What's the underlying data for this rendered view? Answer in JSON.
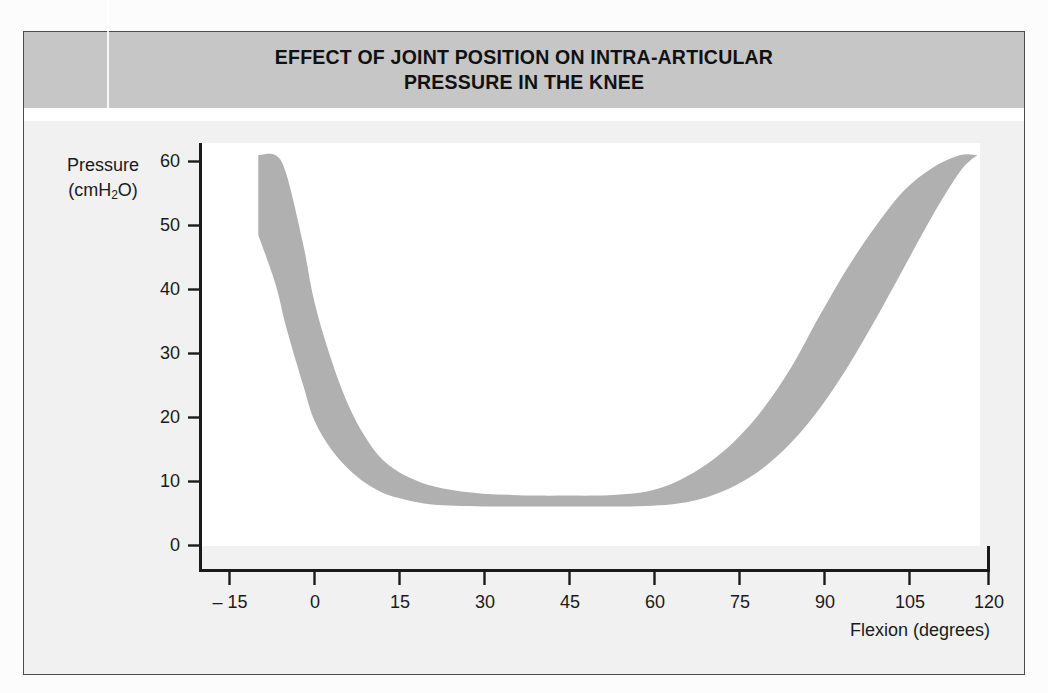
{
  "figure": {
    "title_line1": "EFFECT OF JOINT POSITION ON INTRA-ARTICULAR",
    "title_line2": "PRESSURE IN THE KNEE",
    "banner_color": "#c6c6c6",
    "band_color": "#b0b0b0",
    "plot_background": "#ffffff",
    "axis_color": "#1a1a1a"
  },
  "axes": {
    "y_title_line1": "Pressure",
    "y_title_prefix": "(cmH",
    "y_title_sub": "2",
    "y_title_suffix": "O)",
    "x_title": "Flexion (degrees)"
  },
  "chart_data": {
    "type": "area",
    "title": "EFFECT OF JOINT POSITION ON INTRA-ARTICULAR PRESSURE IN THE KNEE",
    "xlabel": "Flexion (degrees)",
    "ylabel": "Pressure (cmH2O)",
    "xlim": [
      -20,
      120
    ],
    "ylim": [
      0,
      63
    ],
    "xticks": [
      -15,
      0,
      15,
      30,
      45,
      60,
      75,
      90,
      105,
      120
    ],
    "yticks": [
      0,
      10,
      20,
      30,
      40,
      50,
      60
    ],
    "grid": false,
    "legend": null,
    "x": [
      -10,
      -7,
      -5,
      -2,
      0,
      3,
      6,
      9,
      12,
      15,
      18,
      21,
      25,
      30,
      35,
      40,
      45,
      50,
      55,
      60,
      65,
      70,
      75,
      80,
      85,
      90,
      95,
      100,
      105,
      110,
      115,
      118
    ],
    "series": [
      {
        "name": "Upper bound of pressure range",
        "values": [
          61,
          61,
          58,
          47,
          38,
          29,
          22,
          17,
          13.5,
          11.5,
          10.2,
          9.3,
          8.6,
          8.1,
          7.9,
          7.8,
          7.8,
          7.8,
          8.0,
          8.6,
          10.2,
          12.8,
          16.5,
          21.5,
          28.0,
          36.0,
          43.5,
          50.0,
          55.5,
          59.0,
          61.0,
          61.0
        ]
      },
      {
        "name": "Lower bound of pressure range",
        "values": [
          48.5,
          41.0,
          34.0,
          25.0,
          19.5,
          15.0,
          12.0,
          9.8,
          8.3,
          7.4,
          6.8,
          6.4,
          6.2,
          6.1,
          6.1,
          6.1,
          6.1,
          6.1,
          6.1,
          6.2,
          6.6,
          7.6,
          9.4,
          12.2,
          16.2,
          21.5,
          28.0,
          35.5,
          43.5,
          51.5,
          58.5,
          61.0
        ]
      }
    ]
  },
  "ticks": {
    "y": [
      {
        "label": "60",
        "value": 60
      },
      {
        "label": "50",
        "value": 50
      },
      {
        "label": "40",
        "value": 40
      },
      {
        "label": "30",
        "value": 30
      },
      {
        "label": "20",
        "value": 20
      },
      {
        "label": "10",
        "value": 10
      },
      {
        "label": "0",
        "value": 0
      }
    ],
    "x": [
      {
        "label": "– 15",
        "value": -15
      },
      {
        "label": "0",
        "value": 0
      },
      {
        "label": "15",
        "value": 15
      },
      {
        "label": "30",
        "value": 30
      },
      {
        "label": "45",
        "value": 45
      },
      {
        "label": "60",
        "value": 60
      },
      {
        "label": "75",
        "value": 75
      },
      {
        "label": "90",
        "value": 90
      },
      {
        "label": "105",
        "value": 105
      },
      {
        "label": "120",
        "value": 120
      }
    ]
  }
}
